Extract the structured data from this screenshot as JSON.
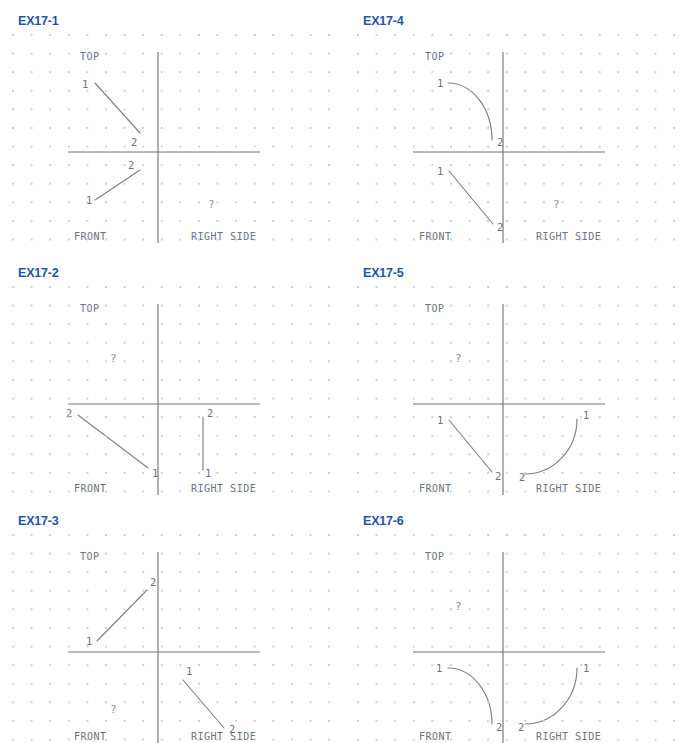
{
  "sheet": {
    "width": 691,
    "height": 729,
    "background": "#ffffff",
    "title_color": "#1f56a8",
    "line_color": "#7b828c",
    "grid_color": "#c9cfd8"
  },
  "view_labels": {
    "top": "TOP",
    "front": "FRONT",
    "right_side": "RIGHT SIDE",
    "unknown": "?"
  },
  "endpoint_labels": {
    "one": "1",
    "two": "2"
  },
  "panels": [
    {
      "id": "ex17-1",
      "title": "EX17-1",
      "col": 0,
      "row": 0,
      "missing_view": "right-side",
      "elements": [
        {
          "view": "top",
          "kind": "line",
          "x1": 95,
          "y1": 55,
          "x2": 140,
          "y2": 105,
          "label1": {
            "text": "1",
            "x": 82,
            "y": 60
          },
          "label2": {
            "text": "2",
            "x": 131,
            "y": 118
          }
        },
        {
          "view": "front",
          "kind": "line",
          "x1": 95,
          "y1": 172,
          "x2": 140,
          "y2": 142,
          "label1": {
            "text": "1",
            "x": 86,
            "y": 176
          },
          "label2": {
            "text": "2",
            "x": 128,
            "y": 141
          }
        }
      ]
    },
    {
      "id": "ex17-2",
      "title": "EX17-2",
      "col": 0,
      "row": 1,
      "missing_view": "top",
      "elements": [
        {
          "view": "front",
          "kind": "line",
          "x1": 78,
          "y1": 135,
          "x2": 148,
          "y2": 188,
          "label1": {
            "text": "1",
            "x": 152,
            "y": 197
          },
          "label2": {
            "text": "2",
            "x": 66,
            "y": 137
          }
        },
        {
          "view": "right-side",
          "kind": "line",
          "x1": 203,
          "y1": 137,
          "x2": 203,
          "y2": 190,
          "label1": {
            "text": "1",
            "x": 205,
            "y": 197
          },
          "label2": {
            "text": "2",
            "x": 207,
            "y": 137
          }
        }
      ]
    },
    {
      "id": "ex17-3",
      "title": "EX17-3",
      "col": 0,
      "row": 2,
      "missing_view": "front",
      "elements": [
        {
          "view": "top",
          "kind": "line",
          "x1": 97,
          "y1": 113,
          "x2": 147,
          "y2": 62,
          "label1": {
            "text": "1",
            "x": 86,
            "y": 117
          },
          "label2": {
            "text": "2",
            "x": 150,
            "y": 58
          }
        },
        {
          "view": "right-side",
          "kind": "line",
          "x1": 183,
          "y1": 152,
          "x2": 224,
          "y2": 200,
          "label1": {
            "text": "1",
            "x": 186,
            "y": 147
          },
          "label2": {
            "text": "2",
            "x": 229,
            "y": 205
          }
        }
      ]
    },
    {
      "id": "ex17-4",
      "title": "EX17-4",
      "col": 1,
      "row": 0,
      "missing_view": "right-side",
      "elements": [
        {
          "view": "top",
          "kind": "arc",
          "x1": 103,
          "y1": 55,
          "x2": 147,
          "y2": 112,
          "cx": 103,
          "cy": 112,
          "label1": {
            "text": "1",
            "x": 92,
            "y": 59
          },
          "label2": {
            "text": "2",
            "x": 152,
            "y": 118
          }
        },
        {
          "view": "front",
          "kind": "line",
          "x1": 104,
          "y1": 143,
          "x2": 148,
          "y2": 196,
          "label1": {
            "text": "1",
            "x": 92,
            "y": 147
          },
          "label2": {
            "text": "2",
            "x": 152,
            "y": 203
          }
        }
      ]
    },
    {
      "id": "ex17-5",
      "title": "EX17-5",
      "col": 1,
      "row": 1,
      "missing_view": "top",
      "elements": [
        {
          "view": "front",
          "kind": "line",
          "x1": 104,
          "y1": 140,
          "x2": 147,
          "y2": 192,
          "label1": {
            "text": "1",
            "x": 92,
            "y": 144
          },
          "label2": {
            "text": "2",
            "x": 150,
            "y": 200
          }
        },
        {
          "view": "right-side",
          "kind": "arc",
          "x1": 180,
          "y1": 194,
          "x2": 232,
          "y2": 139,
          "cx": 180,
          "cy": 139,
          "label1": {
            "text": "1",
            "x": 238,
            "y": 139
          },
          "label2": {
            "text": "2",
            "x": 174,
            "y": 201
          }
        }
      ]
    },
    {
      "id": "ex17-6",
      "title": "EX17-6",
      "col": 1,
      "row": 2,
      "missing_view": "top",
      "elements": [
        {
          "view": "front",
          "kind": "arc",
          "x1": 103,
          "y1": 140,
          "x2": 147,
          "y2": 196,
          "cx": 103,
          "cy": 196,
          "label1": {
            "text": "1",
            "x": 91,
            "y": 144
          },
          "label2": {
            "text": "2",
            "x": 151,
            "y": 203
          }
        },
        {
          "view": "right-side",
          "kind": "arc",
          "x1": 180,
          "y1": 196,
          "x2": 232,
          "y2": 140,
          "cx": 180,
          "cy": 140,
          "label1": {
            "text": "1",
            "x": 238,
            "y": 144
          },
          "label2": {
            "text": "2",
            "x": 173,
            "y": 203
          }
        }
      ]
    }
  ],
  "geometry": {
    "axis_vertical_x": 158,
    "axis_vertical_top": 24,
    "axis_vertical_bottom": 217,
    "axis_horizontal_y": 124,
    "axis_horizontal_left": 68,
    "axis_horizontal_right": 260,
    "label_top": {
      "x": 80,
      "y": 32
    },
    "label_front": {
      "x": 74,
      "y": 212
    },
    "label_right_side": {
      "x": 191,
      "y": 212
    },
    "unknown_marks": {
      "top": {
        "x": 110,
        "y": 82
      },
      "front": {
        "x": 110,
        "y": 185
      },
      "right-side": {
        "x": 208,
        "y": 180
      }
    }
  }
}
